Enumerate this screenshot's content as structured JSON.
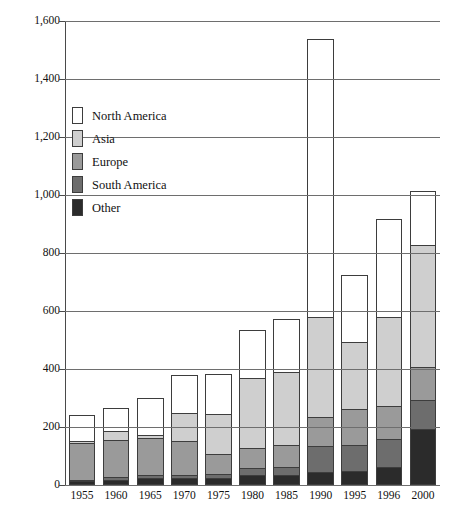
{
  "chart_data": {
    "type": "bar",
    "subtype": "stacked-bar",
    "title": "",
    "xlabel": "",
    "ylabel": "",
    "grid": true,
    "legend_position": "inside-upper-left",
    "ylim": [
      0,
      1600
    ],
    "yticks": [
      0,
      200,
      400,
      600,
      800,
      1000,
      1200,
      1400,
      1600
    ],
    "ytick_labels": [
      "0",
      "200",
      "400",
      "600",
      "800",
      "1,000",
      "1,200",
      "1,400",
      "1,600"
    ],
    "categories": [
      "1955",
      "1960",
      "1965",
      "1970",
      "1975",
      "1980",
      "1985",
      "1990",
      "1995",
      "1996",
      "2000"
    ],
    "series": [
      {
        "name": "Other",
        "color": "#2b2b2b",
        "values": [
          10,
          15,
          22,
          20,
          20,
          30,
          30,
          40,
          45,
          60,
          190
        ]
      },
      {
        "name": "South America",
        "color": "#6d6d6d",
        "values": [
          5,
          8,
          10,
          12,
          15,
          25,
          30,
          90,
          90,
          95,
          100
        ]
      },
      {
        "name": "Europe",
        "color": "#9a9a9a",
        "values": [
          125,
          130,
          128,
          118,
          70,
          70,
          75,
          100,
          125,
          115,
          115
        ]
      },
      {
        "name": "Asia",
        "color": "#cfcfcf",
        "values": [
          10,
          30,
          10,
          95,
          135,
          240,
          250,
          345,
          230,
          305,
          420
        ]
      },
      {
        "name": "North America",
        "color": "#ffffff",
        "values": [
          88,
          80,
          125,
          130,
          140,
          165,
          185,
          960,
          230,
          340,
          185
        ]
      }
    ],
    "totals": [
      238,
      263,
      295,
      375,
      380,
      530,
      570,
      1535,
      720,
      915,
      1010
    ]
  },
  "legend": {
    "items": [
      {
        "label": "North America",
        "color": "#ffffff"
      },
      {
        "label": "Asia",
        "color": "#cfcfcf"
      },
      {
        "label": "Europe",
        "color": "#9a9a9a"
      },
      {
        "label": "South America",
        "color": "#6d6d6d"
      },
      {
        "label": "Other",
        "color": "#2b2b2b"
      }
    ]
  }
}
